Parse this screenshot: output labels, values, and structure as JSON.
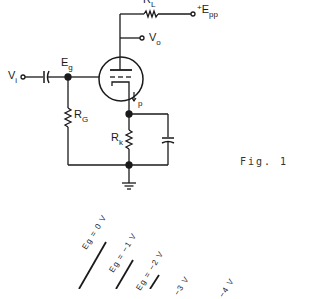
{
  "figure": {
    "caption": "Fig. 1",
    "stroke_color": "#1a1a1a"
  },
  "circuit": {
    "labels": {
      "load_resistor": {
        "main": "R",
        "sub": "L"
      },
      "supply": {
        "sup": "+",
        "main": "E",
        "sub": "pp"
      },
      "output": {
        "main": "V",
        "sub": "o"
      },
      "input": {
        "main": "V",
        "sub": "i"
      },
      "grid_node": {
        "main": "E",
        "sub": "g"
      },
      "grid_resistor": {
        "main": "R",
        "sub": "G"
      },
      "plate_current": {
        "main": "I",
        "sub": "p"
      },
      "cathode_resistor": {
        "main": "R",
        "sub": "k"
      }
    },
    "components": [
      "triode-tube",
      "load-resistor",
      "grid-resistor",
      "cathode-resistor",
      "coupling-capacitor",
      "bypass-capacitor",
      "ground"
    ]
  },
  "curves": {
    "labels": [
      "Eg = 0 V",
      "Eg = −1 V",
      "Eg = −2 V",
      "−3 V",
      "−4 V"
    ]
  }
}
